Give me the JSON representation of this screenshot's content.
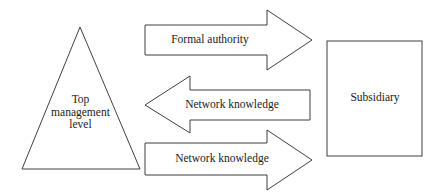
{
  "diagram": {
    "type": "block-arrow-diagram",
    "background_color": "#ffffff",
    "line_color": "#3f3f3f",
    "text_color": "#1a1a1a",
    "nodes": [
      {
        "id": "top-management-level",
        "shape": "triangle",
        "label": "Top\nmanagement\nlevel",
        "label_line_1": "Top",
        "label_line_2": "management",
        "label_line_3": "level"
      },
      {
        "id": "subsidiary",
        "shape": "rectangle",
        "label": "Subsidiary"
      }
    ],
    "arrows": [
      {
        "id": "formal-authority",
        "label": "Formal authority",
        "direction": "right",
        "from": "top-management-level",
        "to": "subsidiary"
      },
      {
        "id": "network-knowledge-upward",
        "label": "Network knowledge",
        "direction": "left",
        "from": "subsidiary",
        "to": "top-management-level"
      },
      {
        "id": "network-knowledge-downward",
        "label": "Network knowledge",
        "direction": "right",
        "from": "top-management-level",
        "to": "subsidiary"
      }
    ]
  }
}
